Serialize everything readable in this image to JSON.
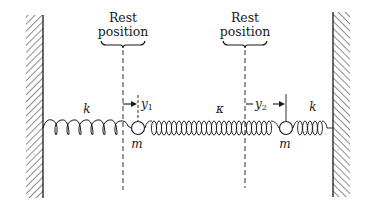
{
  "diagram": {
    "colors": {
      "ink": "#1a1a1a",
      "background": "#ffffff"
    },
    "rest_positions": [
      {
        "line1": "Rest",
        "line2": "position"
      },
      {
        "line1": "Rest",
        "line2": "position"
      }
    ],
    "springs": [
      {
        "label": "k"
      },
      {
        "label": "κ"
      },
      {
        "label": "k"
      }
    ],
    "masses": [
      {
        "label": "m"
      },
      {
        "label": "m"
      }
    ],
    "displacements": [
      {
        "symbol": "y",
        "subscript": "1"
      },
      {
        "symbol": "y",
        "subscript": "2"
      }
    ],
    "walls": [
      {
        "name": "left-wall",
        "hatched": true
      },
      {
        "name": "right-wall",
        "hatched": true
      }
    ]
  }
}
